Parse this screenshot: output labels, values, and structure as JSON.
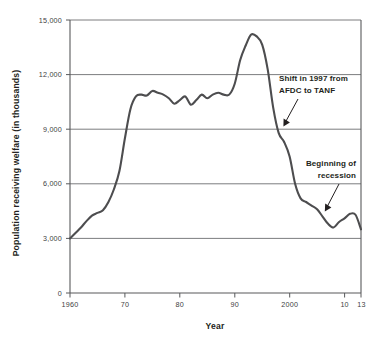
{
  "chart_data": {
    "type": "line",
    "title": "",
    "xlabel": "Year",
    "ylabel": "Population receiving welfare (in thousands)",
    "xlim": [
      1960,
      2013
    ],
    "ylim": [
      0,
      15000
    ],
    "grid": true,
    "legend": "none",
    "y_ticks": [
      "0",
      "3,000",
      "6,000",
      "9,000",
      "12,000",
      "15,000"
    ],
    "y_tick_values": [
      0,
      3000,
      6000,
      9000,
      12000,
      15000
    ],
    "x_ticks": [
      "1960",
      "70",
      "80",
      "90",
      "2000",
      "10",
      "13"
    ],
    "x_tick_values": [
      1960,
      1970,
      1980,
      1990,
      2000,
      2010,
      2013
    ],
    "series": [
      {
        "name": "Population receiving welfare",
        "x": [
          1960,
          1961,
          1962,
          1963,
          1964,
          1965,
          1966,
          1967,
          1968,
          1969,
          1970,
          1971,
          1972,
          1973,
          1974,
          1975,
          1976,
          1977,
          1978,
          1979,
          1980,
          1981,
          1982,
          1983,
          1984,
          1985,
          1986,
          1987,
          1988,
          1989,
          1990,
          1991,
          1992,
          1993,
          1994,
          1995,
          1996,
          1997,
          1998,
          1999,
          2000,
          2001,
          2002,
          2003,
          2004,
          2005,
          2006,
          2007,
          2008,
          2009,
          2010,
          2011,
          2012,
          2013
        ],
        "values": [
          3000,
          3300,
          3600,
          3950,
          4250,
          4400,
          4550,
          5000,
          5700,
          6700,
          8500,
          10100,
          10800,
          10900,
          10850,
          11100,
          11000,
          10900,
          10700,
          10400,
          10600,
          10800,
          10350,
          10600,
          10900,
          10700,
          10900,
          11000,
          10900,
          10900,
          11500,
          12800,
          13600,
          14200,
          14100,
          13650,
          12300,
          10200,
          8800,
          8300,
          7500,
          6000,
          5200,
          5000,
          4800,
          4600,
          4200,
          3800,
          3600,
          3900,
          4100,
          4350,
          4300,
          3500
        ]
      }
    ],
    "annotations": [
      {
        "id": "shift-annotation",
        "line1": "Shift in 1997 from",
        "line2": "AFDC to TANF",
        "points_to_year": 1998,
        "points_to_value": 8700
      },
      {
        "id": "recession-annotation",
        "line1": "Beginning of",
        "line2": "recession",
        "points_to_year": 2008,
        "points_to_value": 3700
      }
    ]
  },
  "colors": {
    "line": "#4d4d4f",
    "grid": "#6d6e71",
    "axis": "#58595b",
    "text": "#231f20",
    "background": "#ffffff"
  }
}
